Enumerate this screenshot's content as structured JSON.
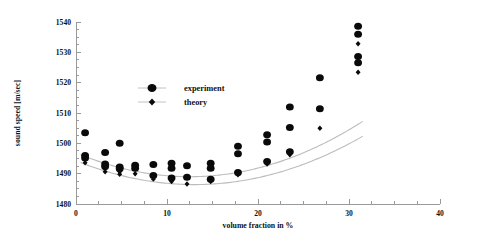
{
  "chart_data": {
    "type": "scatter",
    "title": "",
    "xlabel": "volume fraction in %",
    "ylabel": "sound speed [m/sec]",
    "xlim": [
      0,
      40
    ],
    "ylim": [
      1480,
      1540
    ],
    "xticks": [
      0,
      10,
      20,
      30,
      40
    ],
    "xticklabels": [
      "0",
      "10",
      "20",
      "30",
      "40"
    ],
    "yticks": [
      1480,
      1490,
      1500,
      1510,
      1520,
      1530,
      1540
    ],
    "yticklabels": [
      "1480",
      "1490",
      "1500",
      "1510",
      "1520",
      "1530",
      "1540"
    ],
    "xminor_step": 2.5,
    "yminor_step": 2.5,
    "grid": false,
    "legend_position": "upper-center-left",
    "series": [
      {
        "name": "experiment",
        "marker": "circle",
        "color": "#0a0a0a",
        "points": [
          [
            1.0,
            1503.5
          ],
          [
            1.0,
            1496.0
          ],
          [
            1.0,
            1495.2
          ],
          [
            3.2,
            1497.0
          ],
          [
            3.2,
            1493.2
          ],
          [
            3.2,
            1492.4
          ],
          [
            4.8,
            1500.0
          ],
          [
            4.8,
            1492.2
          ],
          [
            4.8,
            1491.6
          ],
          [
            6.5,
            1492.8
          ],
          [
            6.5,
            1491.8
          ],
          [
            8.5,
            1493.0
          ],
          [
            8.5,
            1489.4
          ],
          [
            10.5,
            1493.4
          ],
          [
            10.5,
            1491.8
          ],
          [
            10.5,
            1488.6
          ],
          [
            12.2,
            1492.6
          ],
          [
            12.2,
            1488.8
          ],
          [
            14.8,
            1493.4
          ],
          [
            14.8,
            1491.8
          ],
          [
            14.8,
            1488.2
          ],
          [
            17.8,
            1499.0
          ],
          [
            17.8,
            1496.6
          ],
          [
            17.8,
            1490.4
          ],
          [
            21.0,
            1502.8
          ],
          [
            21.0,
            1500.4
          ],
          [
            21.0,
            1494.0
          ],
          [
            23.5,
            1512.0
          ],
          [
            23.5,
            1505.2
          ],
          [
            23.5,
            1497.2
          ],
          [
            26.8,
            1521.6
          ],
          [
            26.8,
            1511.4
          ],
          [
            31.0,
            1538.6
          ],
          [
            31.0,
            1536.0
          ],
          [
            31.0,
            1528.6
          ],
          [
            31.0,
            1526.6
          ]
        ]
      },
      {
        "name": "theory",
        "marker": "diamond",
        "color": "#0a0a0a",
        "points": [
          [
            1.0,
            1494.6
          ],
          [
            1.0,
            1493.6
          ],
          [
            3.2,
            1491.6
          ],
          [
            3.2,
            1490.6
          ],
          [
            4.8,
            1490.6
          ],
          [
            4.8,
            1489.8
          ],
          [
            6.5,
            1490.0
          ],
          [
            8.5,
            1488.2
          ],
          [
            10.5,
            1487.4
          ],
          [
            12.2,
            1486.6
          ],
          [
            14.8,
            1487.4
          ],
          [
            17.8,
            1489.6
          ],
          [
            21.0,
            1493.2
          ],
          [
            23.5,
            1496.2
          ],
          [
            26.8,
            1505.0
          ],
          [
            31.0,
            1532.8
          ],
          [
            31.0,
            1523.4
          ]
        ]
      }
    ],
    "fit_curves": [
      {
        "name": "experiment-fit",
        "color": "#bcbcbc",
        "vertex": [
          12.5,
          1489.0
        ],
        "curvature": 0.0505,
        "xrange": [
          0.5,
          31.5
        ]
      },
      {
        "name": "theory-fit",
        "color": "#bcbcbc",
        "vertex": [
          13.0,
          1486.4
        ],
        "curvature": 0.0465,
        "xrange": [
          0.5,
          31.5
        ]
      }
    ],
    "legend": [
      {
        "label": "experiment",
        "marker": "circle"
      },
      {
        "label": "theory",
        "marker": "diamond"
      }
    ]
  }
}
